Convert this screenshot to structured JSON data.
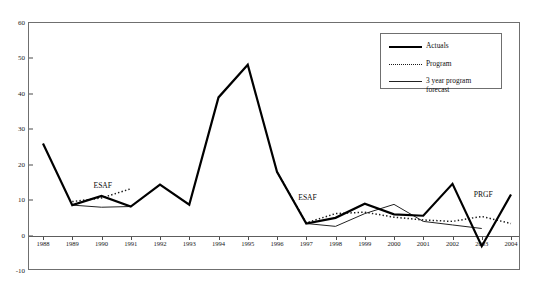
{
  "title": "",
  "chart_data": {
    "type": "line",
    "title": "",
    "subtitle": "",
    "xlabel": "",
    "ylabel": "",
    "x": [
      1988,
      1989,
      1990,
      1991,
      1992,
      1993,
      1994,
      1995,
      1996,
      1997,
      1998,
      1999,
      2000,
      2001,
      2002,
      2003,
      2004
    ],
    "tick_labels": [
      "1988",
      "1989",
      "1990",
      "1991",
      "1992",
      "1993",
      "1994",
      "1995",
      "1996",
      "1997",
      "1998",
      "1999",
      "2000",
      "2001",
      "2002",
      "2003",
      "2004"
    ],
    "ylim": [
      -10,
      60
    ],
    "yticks": [
      -10,
      0,
      10,
      20,
      30,
      40,
      50,
      60
    ],
    "ytick_labels": [
      "-10",
      "0",
      "10",
      "20",
      "30",
      "40",
      "50",
      "60"
    ],
    "grid": false,
    "legend_position": "top-right",
    "series": [
      {
        "name": "Actuals",
        "style": "solid-thick",
        "color": "#000000",
        "x": [
          1988,
          1989,
          1990,
          1991,
          1992,
          1993,
          1994,
          1995,
          1996,
          1997,
          1998,
          1999,
          2000,
          2001,
          2002,
          2003,
          2004
        ],
        "values": [
          26.0,
          8.6,
          11.2,
          8.2,
          14.4,
          8.7,
          39.0,
          48.2,
          18.0,
          3.4,
          5.0,
          9.0,
          6.0,
          5.6,
          14.6,
          -3.0,
          11.6
        ]
      },
      {
        "name": "Program",
        "style": "dotted",
        "color": "#1a1a1a",
        "segments": [
          {
            "x": [
              1989,
              1990,
              1991
            ],
            "values": [
              9.6,
              10.6,
              13.2
            ]
          },
          {
            "x": [
              1996,
              1997,
              1998,
              1999,
              2000,
              2001,
              2002,
              2003,
              2004
            ],
            "values": [
              18.0,
              3.6,
              6.2,
              6.6,
              5.2,
              4.4,
              4.0,
              5.4,
              3.4
            ]
          }
        ]
      },
      {
        "name": "3 year program forecast",
        "style": "solid-thin",
        "color": "#222222",
        "segments": [
          {
            "x": [
              1989,
              1990,
              1991
            ],
            "values": [
              8.6,
              8.0,
              8.2
            ]
          },
          {
            "x": [
              1997,
              1998,
              1999,
              2000,
              2001,
              2002,
              2003
            ],
            "values": [
              3.4,
              2.6,
              6.2,
              8.8,
              4.0,
              3.0,
              2.0
            ]
          }
        ]
      }
    ],
    "annotations": [
      {
        "text": "ESAF",
        "x": 1990,
        "y": 14.0
      },
      {
        "text": "ESAF",
        "x": 1997,
        "y": 10.5
      },
      {
        "text": "PRGF",
        "x": 2003,
        "y": 11.5
      }
    ]
  },
  "legend": {
    "items": [
      {
        "label": "Actuals",
        "style": "solid-thick"
      },
      {
        "label": "Program",
        "style": "dotted"
      },
      {
        "label": "3 year program",
        "style": "solid-thin"
      }
    ],
    "continuation": "forecast"
  }
}
